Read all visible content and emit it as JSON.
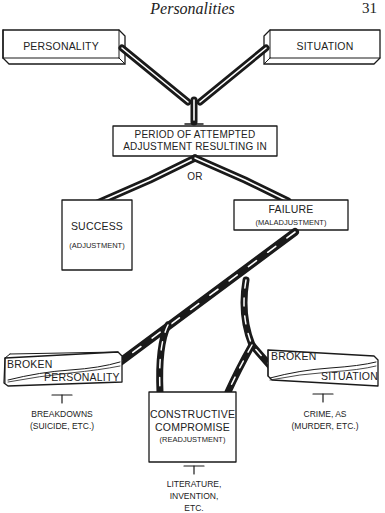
{
  "header": {
    "title": "Personalities",
    "page_number": "31"
  },
  "nodes": {
    "personality": {
      "label": "PERSONALITY"
    },
    "situation": {
      "label": "SITUATION"
    },
    "period": {
      "line1": "PERIOD OF ATTEMPTED",
      "line2": "ADJUSTMENT RESULTING IN"
    },
    "or": {
      "label": "OR"
    },
    "success": {
      "label": "SUCCESS",
      "sub": "(ADJUSTMENT)"
    },
    "failure": {
      "label": "FAILURE",
      "sub": "(MALADJUSTMENT)"
    },
    "broken_personality": {
      "line1": "BROKEN",
      "line2": "PERSONALITY",
      "note_line1": "BREAKDOWNS",
      "note_line2": "(SUICIDE, ETC.)"
    },
    "constructive": {
      "line1": "CONSTRUCTIVE",
      "line2": "COMPROMISE",
      "sub": "(READJUSTMENT)",
      "note_line1": "LITERATURE,",
      "note_line2": "INVENTION,",
      "note_line3": "ETC."
    },
    "broken_situation": {
      "line1": "BROKEN",
      "line2": "SITUATION",
      "note_line1": "CRIME, AS",
      "note_line2": "(MURDER, ETC.)"
    }
  },
  "colors": {
    "ink": "#1a1a1a",
    "paper": "#ffffff"
  }
}
